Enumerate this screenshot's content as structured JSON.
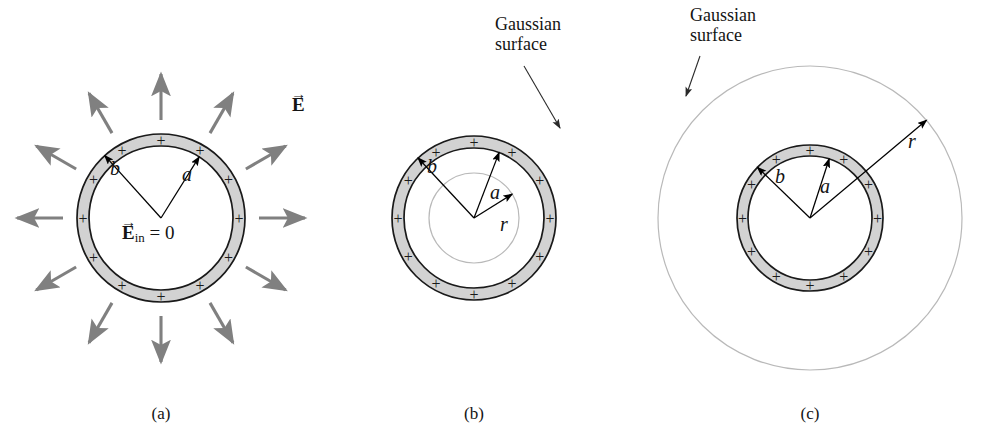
{
  "figure": {
    "background_color": "#ffffff",
    "width": 996,
    "height": 448
  },
  "style": {
    "shell_fill": "#d2d2d2",
    "shell_stroke": "#1a1a1a",
    "field_arrow_color": "#808080",
    "gaussian_stroke": "#b9b9b9",
    "radius_arrow_color": "#000000",
    "text_color": "#141414",
    "plus_color": "#1a1a1a"
  },
  "panels": [
    {
      "id": "a",
      "caption": "(a)",
      "caption_x": 161,
      "caption_y": 404,
      "center": {
        "x": 161,
        "y": 218
      },
      "shell": {
        "inner_radius": 72,
        "outer_radius": 84
      },
      "plus_count": 12,
      "plus_start_angle_deg": -90,
      "field_arrows": {
        "count": 12,
        "start_angle_deg": -90,
        "inner_offset": 14,
        "length": 46,
        "color": "#808080"
      },
      "radius_labels": [
        {
          "name": "b",
          "text": "b",
          "angle_deg": -132,
          "to_radius": 84,
          "label_x": 110,
          "label_y": 157
        },
        {
          "name": "a",
          "text": "a",
          "angle_deg": -58,
          "to_radius": 72,
          "label_x": 182,
          "label_y": 163
        }
      ],
      "annotations": [
        {
          "name": "field-vector-label",
          "kind": "e-vector",
          "text": "E",
          "subscript": "",
          "suffix": "",
          "x": 292,
          "y": 94
        },
        {
          "name": "interior-field-label",
          "kind": "e-vector",
          "text": "E",
          "subscript": "in",
          "suffix": " = 0",
          "x": 122,
          "y": 222
        }
      ],
      "gaussian_surface": null
    },
    {
      "id": "b",
      "caption": "(b)",
      "caption_x": 474,
      "caption_y": 404,
      "center": {
        "x": 474,
        "y": 218
      },
      "shell": {
        "inner_radius": 70,
        "outer_radius": 82
      },
      "plus_count": 12,
      "plus_start_angle_deg": -90,
      "field_arrows": null,
      "radius_labels": [
        {
          "name": "b",
          "text": "b",
          "angle_deg": -133,
          "to_radius": 82,
          "label_x": 427,
          "label_y": 155
        },
        {
          "name": "a",
          "text": "a",
          "angle_deg": -69,
          "to_radius": 70,
          "label_x": 490,
          "label_y": 181
        },
        {
          "name": "r",
          "text": "r",
          "angle_deg": -32,
          "to_radius": 45,
          "label_x": 500,
          "label_y": 213
        }
      ],
      "gaussian_surface": {
        "radius": 45,
        "label": "Gaussian\nsurface",
        "label_line1": "Gaussian",
        "label_line2": "surface",
        "label_x": 495,
        "label_y": 14,
        "leader": {
          "x1": 524,
          "y1": 66,
          "x2": 560,
          "y2": 128
        }
      },
      "annotations": []
    },
    {
      "id": "c",
      "caption": "(c)",
      "caption_x": 810,
      "caption_y": 404,
      "center": {
        "x": 810,
        "y": 218
      },
      "shell": {
        "inner_radius": 62,
        "outer_radius": 73
      },
      "plus_count": 12,
      "plus_start_angle_deg": -90,
      "field_arrows": null,
      "radius_labels": [
        {
          "name": "b",
          "text": "b",
          "angle_deg": -136,
          "to_radius": 73,
          "label_x": 775,
          "label_y": 165
        },
        {
          "name": "a",
          "text": "a",
          "angle_deg": -72,
          "to_radius": 62,
          "label_x": 820,
          "label_y": 175
        },
        {
          "name": "r",
          "text": "r",
          "angle_deg": -40,
          "to_radius": 152,
          "label_x": 908,
          "label_y": 130
        }
      ],
      "gaussian_surface": {
        "radius": 152,
        "label_line1": "Gaussian",
        "label_line2": "surface",
        "label_x": 690,
        "label_y": 5,
        "leader": {
          "x1": 700,
          "y1": 56,
          "x2": 686,
          "y2": 96
        }
      },
      "annotations": []
    }
  ],
  "symbols": {
    "plus": "+",
    "vector_arrow": "→",
    "equals_zero": " = 0"
  }
}
